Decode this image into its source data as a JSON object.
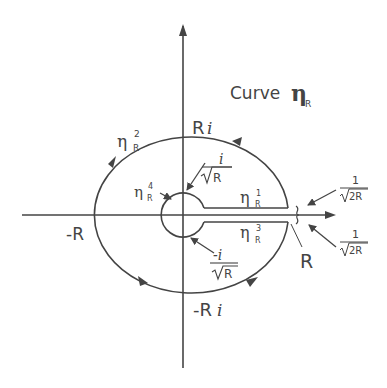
{
  "title": {
    "word": "Curve",
    "symbol": "η",
    "subscript": "R"
  },
  "axes": {
    "real_positive": "R",
    "real_negative": "-R",
    "imag_positive_R": "R",
    "imag_positive_i": "i",
    "imag_negative_R": "-R",
    "imag_negative_i": "i"
  },
  "segments": {
    "eta1": {
      "symbol": "η",
      "sup": "1",
      "sub": "R"
    },
    "eta2": {
      "symbol": "η",
      "sup": "2",
      "sub": "R"
    },
    "eta3": {
      "symbol": "η",
      "sup": "3",
      "sub": "R"
    },
    "eta4": {
      "symbol": "η",
      "sup": "4",
      "sub": "R"
    }
  },
  "annotations": {
    "small_top": {
      "num": "i",
      "den": "R"
    },
    "small_bottom": {
      "num": "-i",
      "den": "R"
    },
    "gap_top": {
      "num": "1",
      "den": "2R"
    },
    "gap_bottom": {
      "num": "1",
      "den": "2R"
    }
  },
  "colors": {
    "stroke": "#444444",
    "background": "#ffffff"
  }
}
